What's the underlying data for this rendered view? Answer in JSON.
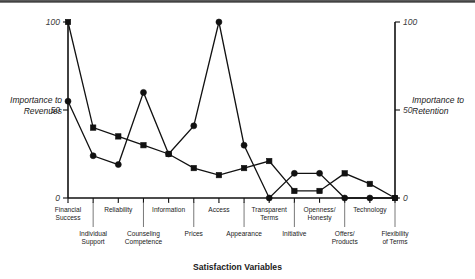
{
  "chart_data": {
    "type": "line",
    "title": "",
    "xlabel": "Satisfaction Variables",
    "ylabel": "Importance to Revenues",
    "y2label": "Importance to Retention",
    "ylim": [
      0,
      100
    ],
    "y2lim": [
      0,
      100
    ],
    "yticks": [
      0,
      50,
      100
    ],
    "y2ticks": [
      0,
      50,
      100
    ],
    "ytick_labels": [
      "0",
      "50",
      "100"
    ],
    "y2tick_labels": [
      "0",
      "50",
      "100"
    ],
    "grid": false,
    "legend": "none",
    "categories": [
      "Financial Success",
      "Individual Support",
      "Reliability",
      "Counseling Competence",
      "Information",
      "Prices",
      "Access",
      "Appearance",
      "Transparent Terms",
      "Initiative",
      "Openness/ Honesty",
      "Offers/ Products",
      "Technology",
      "Flexibility of Terms"
    ],
    "category_rows": [
      {
        "label": "Financial Success",
        "line1": "Financial",
        "line2": "Success",
        "row": "top"
      },
      {
        "label": "Individual Support",
        "line1": "Individual",
        "line2": "Support",
        "row": "bottom"
      },
      {
        "label": "Reliability",
        "line1": "Reliability",
        "line2": "",
        "row": "top"
      },
      {
        "label": "Counseling Competence",
        "line1": "Counseling",
        "line2": "Competence",
        "row": "bottom"
      },
      {
        "label": "Information",
        "line1": "Information",
        "line2": "",
        "row": "top"
      },
      {
        "label": "Prices",
        "line1": "Prices",
        "line2": "",
        "row": "bottom"
      },
      {
        "label": "Access",
        "line1": "Access",
        "line2": "",
        "row": "top"
      },
      {
        "label": "Appearance",
        "line1": "Appearance",
        "line2": "",
        "row": "bottom"
      },
      {
        "label": "Transparent Terms",
        "line1": "Transparent",
        "line2": "Terms",
        "row": "top"
      },
      {
        "label": "Initiative",
        "line1": "Initiative",
        "line2": "",
        "row": "bottom"
      },
      {
        "label": "Openness/ Honesty",
        "line1": "Openness/",
        "line2": "Honesty",
        "row": "top"
      },
      {
        "label": "Offers/ Products",
        "line1": "Offers/",
        "line2": "Products",
        "row": "bottom"
      },
      {
        "label": "Technology",
        "line1": "Technology",
        "line2": "",
        "row": "top"
      },
      {
        "label": "Flexibility of Terms",
        "line1": "Flexibility",
        "line2": "of Terms",
        "row": "bottom"
      }
    ],
    "series": [
      {
        "name": "Importance to Revenues",
        "marker": "square",
        "axis": "left",
        "values": [
          100,
          40,
          35,
          30,
          25,
          17,
          13,
          17,
          21,
          4,
          4,
          14,
          8,
          0
        ]
      },
      {
        "name": "Importance to Retention",
        "marker": "circle",
        "axis": "right",
        "values": [
          55,
          24,
          19,
          60,
          25,
          41,
          100,
          30,
          0,
          14,
          14,
          0,
          0,
          0
        ]
      }
    ]
  },
  "colors": {
    "ink": "#111111",
    "background": "#ffffff"
  }
}
